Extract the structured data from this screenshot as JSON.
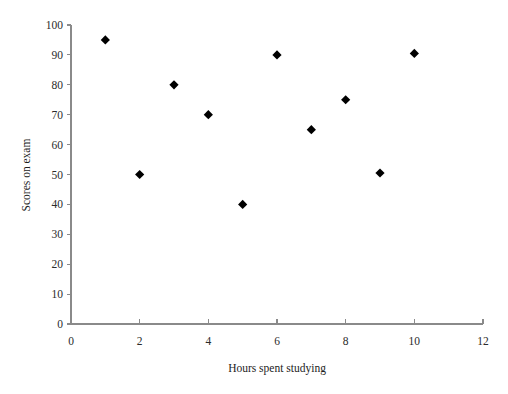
{
  "chart_data": {
    "type": "scatter",
    "title": "",
    "xlabel": "Hours spent studying",
    "ylabel": "Scores on exam",
    "xlim": [
      0,
      12
    ],
    "ylim": [
      0,
      100
    ],
    "grid": false,
    "legend": false,
    "marker": "filled-diamond",
    "marker_color": "#000000",
    "x_ticks": [
      0,
      2,
      4,
      6,
      8,
      10,
      12
    ],
    "y_ticks": [
      0,
      10,
      20,
      30,
      40,
      50,
      60,
      70,
      80,
      90,
      100
    ],
    "x_tick_labels": [
      "0",
      "2",
      "4",
      "6",
      "8",
      "10",
      "12"
    ],
    "y_tick_labels": [
      "0",
      "10",
      "20",
      "30",
      "40",
      "50",
      "60",
      "70",
      "80",
      "90",
      "100"
    ],
    "x": [
      1,
      2,
      3,
      4,
      5,
      6,
      7,
      8,
      9,
      10
    ],
    "y": [
      95,
      50,
      80,
      70,
      40,
      90,
      65,
      75,
      50.5,
      90.5
    ],
    "points": [
      {
        "x": 1,
        "y": 95
      },
      {
        "x": 2,
        "y": 50
      },
      {
        "x": 3,
        "y": 80
      },
      {
        "x": 4,
        "y": 70
      },
      {
        "x": 5,
        "y": 40
      },
      {
        "x": 6,
        "y": 90
      },
      {
        "x": 7,
        "y": 65
      },
      {
        "x": 8,
        "y": 75
      },
      {
        "x": 9,
        "y": 50.5
      },
      {
        "x": 10,
        "y": 90.5
      }
    ]
  },
  "axes": {
    "x_title": "Hours spent studying",
    "y_title": "Scores on exam"
  }
}
